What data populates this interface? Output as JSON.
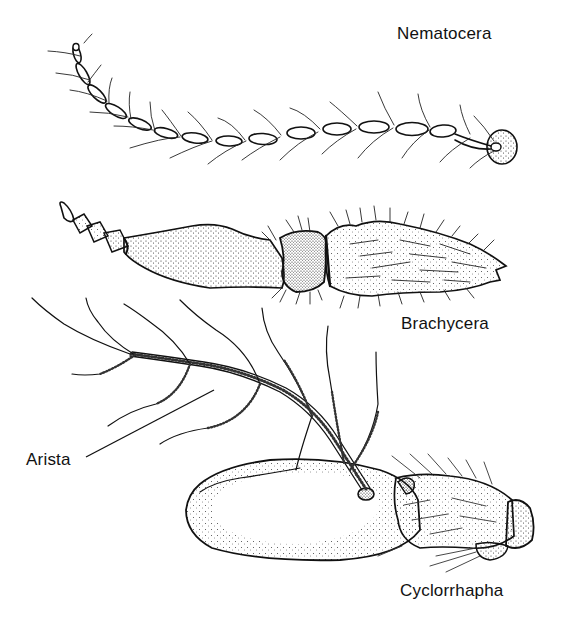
{
  "figure": {
    "labels": {
      "nematocera": "Nematocera",
      "brachycera": "Brachycera",
      "cyclorrhapha": "Cyclorrhapha",
      "arista": "Arista"
    },
    "colors": {
      "ink": "#111111",
      "background": "#ffffff"
    }
  }
}
